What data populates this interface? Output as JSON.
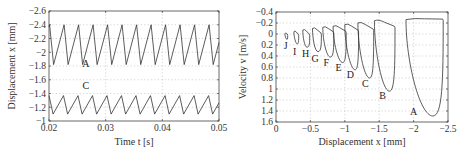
{
  "chart_data": [
    {
      "type": "line",
      "title": "",
      "xlabel": "Time  t  [s]",
      "ylabel": "Displacement  x  [mm]",
      "xlim": [
        0.02,
        0.05
      ],
      "ylim": [
        -2.6,
        -1.0
      ],
      "y_reversed": true,
      "grid": true,
      "x_ticks": [
        "0.02",
        "0.03",
        "0.04",
        "0.05"
      ],
      "x_tick_values": [
        0.02,
        0.03,
        0.04,
        0.05
      ],
      "y_ticks": [
        "-2.6",
        "-2.4",
        "-2.2",
        "-2",
        "-1.8",
        "-1.6",
        "-1.4",
        "-1.2",
        "-1"
      ],
      "y_tick_values": [
        -2.6,
        -2.4,
        -2.2,
        -2.0,
        -1.8,
        -1.6,
        -1.4,
        -1.2,
        -1.0
      ],
      "series": [
        {
          "name": "A",
          "shape": "sawtooth",
          "max": -2.4,
          "min": -1.82,
          "period_s": 0.00256,
          "phase_s": 0.0201,
          "label_pos": [
            0.0265,
            -1.78
          ]
        },
        {
          "name": "C",
          "shape": "sawtooth",
          "max": -1.37,
          "min": -1.1,
          "period_s": 0.00256,
          "phase_s": 0.02,
          "label_pos": [
            0.0265,
            -1.46
          ]
        }
      ]
    },
    {
      "type": "line",
      "title": "",
      "xlabel": "Displacement  x  [mm]",
      "ylabel": "Velocity  v  [m/s]",
      "xlim": [
        0,
        -2.5
      ],
      "ylim": [
        -0.4,
        1.6
      ],
      "y_reversed": true,
      "grid": true,
      "x_ticks": [
        "0",
        "-0.5",
        "-1",
        "-1.5",
        "-2",
        "-2.5"
      ],
      "x_tick_values": [
        0,
        -0.5,
        -1,
        -1.5,
        -2,
        -2.5
      ],
      "y_ticks": [
        "-0.4",
        "-0.2",
        "0",
        "0.2",
        "0.4",
        "0.6",
        "0.8",
        "1",
        "1.2",
        "1.4",
        "1.6"
      ],
      "y_tick_values": [
        -0.4,
        -0.2,
        0,
        0.2,
        0.4,
        0.6,
        0.8,
        1.0,
        1.2,
        1.4,
        1.6
      ],
      "series": [
        {
          "name": "J",
          "x_left": -0.13,
          "x_right": -0.17,
          "v_top_left": -0.02,
          "v_top_right": 0.0,
          "v_min": 0.1,
          "x_at_min": -0.16,
          "label_pos": [
            -0.14,
            0.22
          ]
        },
        {
          "name": "I",
          "x_left": -0.26,
          "x_right": -0.33,
          "v_top_left": -0.06,
          "v_top_right": 0.0,
          "v_min": 0.18,
          "x_at_min": -0.31,
          "label_pos": [
            -0.27,
            0.32
          ]
        },
        {
          "name": "H",
          "x_left": -0.39,
          "x_right": -0.49,
          "v_top_left": -0.09,
          "v_top_right": 0.0,
          "v_min": 0.24,
          "x_at_min": -0.45,
          "label_pos": [
            -0.43,
            0.37
          ]
        },
        {
          "name": "G",
          "x_left": -0.53,
          "x_right": -0.66,
          "v_top_left": -0.12,
          "v_top_right": -0.02,
          "v_min": 0.32,
          "x_at_min": -0.61,
          "label_pos": [
            -0.57,
            0.45
          ]
        },
        {
          "name": "F",
          "x_left": -0.68,
          "x_right": -0.84,
          "v_top_left": -0.14,
          "v_top_right": -0.04,
          "v_min": 0.42,
          "x_at_min": -0.79,
          "label_pos": [
            -0.73,
            0.52
          ]
        },
        {
          "name": "E",
          "x_left": -0.83,
          "x_right": -1.02,
          "v_top_left": -0.16,
          "v_top_right": -0.05,
          "v_min": 0.52,
          "x_at_min": -0.97,
          "label_pos": [
            -0.91,
            0.62
          ]
        },
        {
          "name": "D",
          "x_left": -1.0,
          "x_right": -1.2,
          "v_top_left": -0.19,
          "v_top_right": -0.07,
          "v_min": 0.65,
          "x_at_min": -1.15,
          "label_pos": [
            -1.08,
            0.75
          ]
        },
        {
          "name": "C",
          "x_left": -1.19,
          "x_right": -1.42,
          "v_top_left": -0.22,
          "v_top_right": -0.09,
          "v_min": 0.8,
          "x_at_min": -1.36,
          "label_pos": [
            -1.3,
            0.9
          ]
        },
        {
          "name": "B",
          "x_left": -1.43,
          "x_right": -1.73,
          "v_top_left": -0.26,
          "v_top_right": -0.14,
          "v_min": 1.04,
          "x_at_min": -1.65,
          "label_pos": [
            -1.55,
            1.13
          ]
        },
        {
          "name": "A",
          "x_left": -1.89,
          "x_right": -2.43,
          "v_top_left": -0.28,
          "v_top_right": -0.27,
          "v_min": 1.49,
          "x_at_min": -2.28,
          "label_pos": [
            -2.0,
            1.42
          ]
        }
      ]
    }
  ],
  "left_plot": {
    "xlabel": "Time  t  [s]",
    "ylabel": "Displacement  x  [mm]"
  },
  "right_plot": {
    "xlabel": "Displacement  x  [mm]",
    "ylabel": "Velocity  v  [m/s]"
  }
}
